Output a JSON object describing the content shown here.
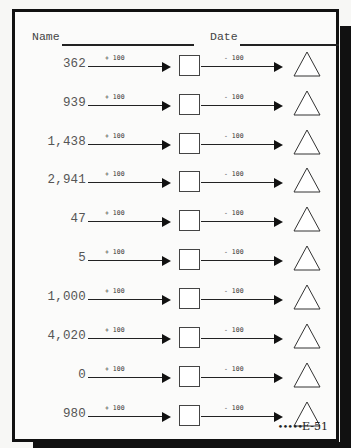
{
  "header": {
    "name_label": "Name",
    "date_label": "Date"
  },
  "operations": {
    "add_label": "+ 100",
    "subtract_label": "- 100"
  },
  "rows": [
    {
      "start": "362"
    },
    {
      "start": "939"
    },
    {
      "start": "1,438"
    },
    {
      "start": "2,941"
    },
    {
      "start": "47"
    },
    {
      "start": "5"
    },
    {
      "start": "1,000"
    },
    {
      "start": "4,020"
    },
    {
      "start": "0"
    },
    {
      "start": "980"
    }
  ],
  "footer": {
    "dots": "•••••",
    "code": "E-51"
  },
  "colors": {
    "border": "#111111",
    "paper": "#fbfbfa",
    "ink": "#333333"
  }
}
